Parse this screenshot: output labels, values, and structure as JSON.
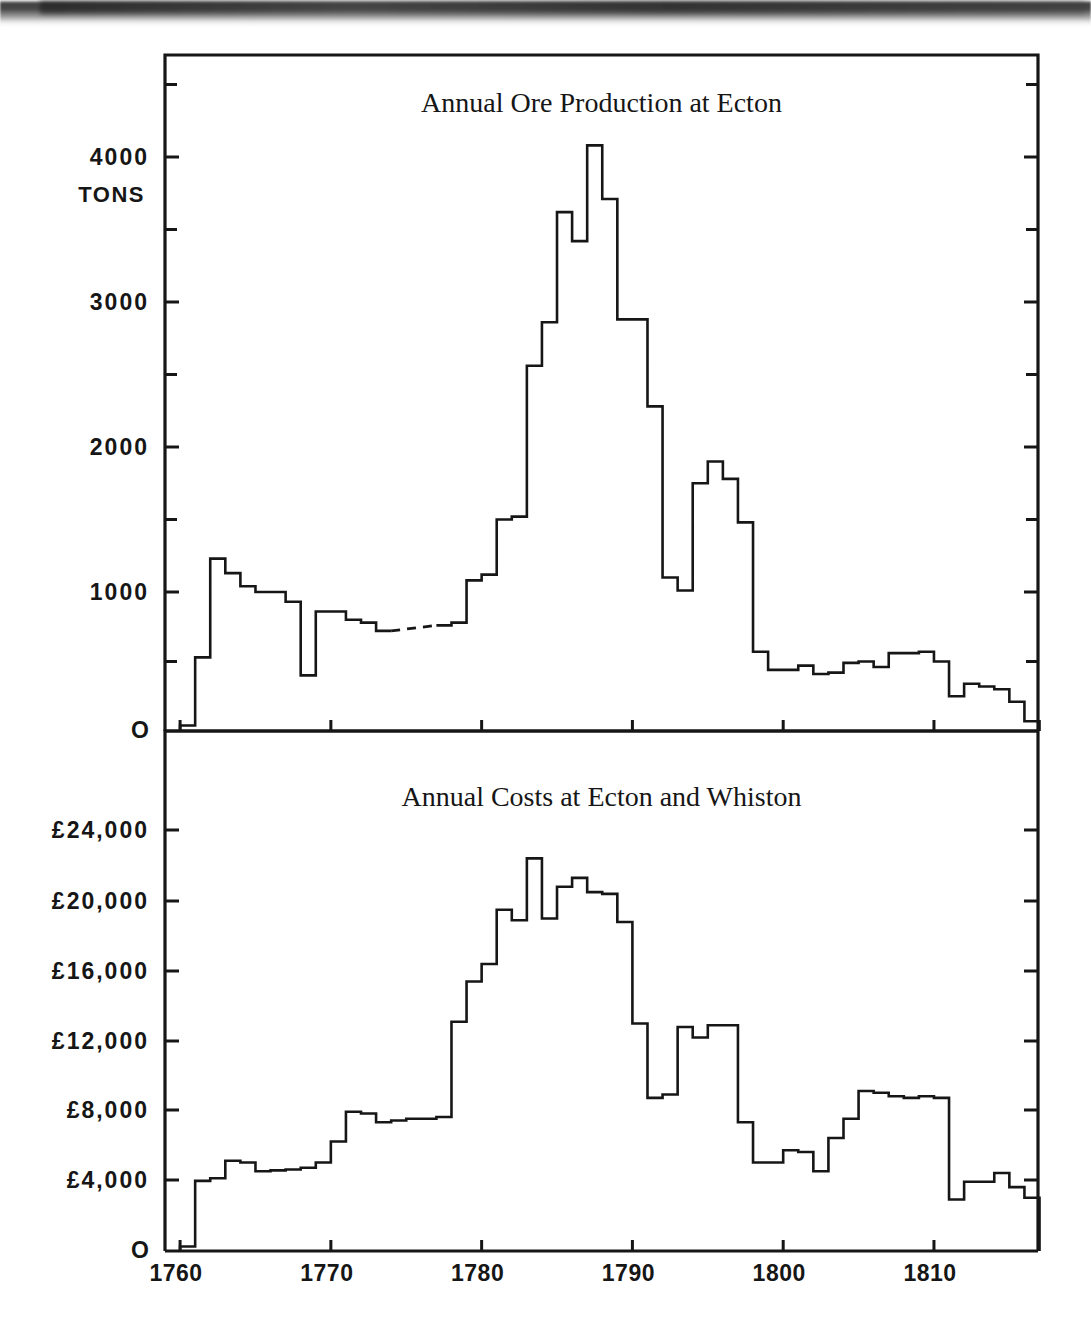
{
  "page": {
    "background": "#ffffff",
    "ink": "#161616",
    "scan_artifact": "dark-shadow-band-top"
  },
  "chart_data": [
    {
      "id": "ore-production",
      "type": "line",
      "step": true,
      "title": "Annual Ore Production at Ecton",
      "xlabel": "",
      "ylabel": "TONS",
      "xlim": [
        1759,
        1817
      ],
      "ylim": [
        0,
        4750
      ],
      "yticks_major": [
        0,
        1000,
        2000,
        3000,
        4000
      ],
      "yticks_minor": [
        500,
        1500,
        2500,
        3500,
        4500
      ],
      "ytick_labels": [
        "O",
        "1000",
        "2000",
        "3000",
        "4000"
      ],
      "xticks": [
        1760,
        1770,
        1780,
        1790,
        1800,
        1810
      ],
      "xtick_labels": [
        "1760",
        "1770",
        "1780",
        "1790",
        "1800",
        "1810"
      ],
      "grid": false,
      "legend": "none",
      "units": "tons",
      "annotation": "dashed segment 1774-1776 indicates estimated values",
      "x": [
        1760,
        1761,
        1762,
        1763,
        1764,
        1765,
        1766,
        1767,
        1768,
        1769,
        1770,
        1771,
        1772,
        1773,
        1774,
        1775,
        1776,
        1777,
        1778,
        1779,
        1780,
        1781,
        1782,
        1783,
        1784,
        1785,
        1786,
        1787,
        1788,
        1789,
        1790,
        1791,
        1792,
        1793,
        1794,
        1795,
        1796,
        1797,
        1798,
        1799,
        1800,
        1801,
        1802,
        1803,
        1804,
        1805,
        1806,
        1807,
        1808,
        1809,
        1810,
        1811,
        1812,
        1813,
        1814,
        1815,
        1816
      ],
      "values": [
        40,
        530,
        1230,
        1130,
        1040,
        1000,
        1000,
        930,
        400,
        860,
        860,
        800,
        780,
        720,
        680,
        660,
        700,
        760,
        780,
        1080,
        1120,
        1500,
        1520,
        2560,
        2860,
        3620,
        3420,
        4080,
        3710,
        2880,
        2880,
        2280,
        1100,
        1010,
        1750,
        1900,
        1780,
        1480,
        570,
        440,
        440,
        470,
        410,
        420,
        490,
        500,
        460,
        560,
        560,
        570,
        500,
        250,
        340,
        320,
        300,
        210,
        70
      ],
      "dashed_segment": {
        "x_from": 1773,
        "x_to": 1777
      }
    },
    {
      "id": "annual-costs",
      "type": "line",
      "step": true,
      "title": "Annual Costs at Ecton and Whiston",
      "xlabel": "",
      "ylabel": "",
      "xlim": [
        1759,
        1817
      ],
      "ylim": [
        0,
        25800
      ],
      "yticks_major": [
        0,
        4000,
        8000,
        12000,
        16000,
        20000,
        24000
      ],
      "ytick_labels": [
        "O",
        "£4,000",
        "£8,000",
        "£12,000",
        "£16,000",
        "£20,000",
        "£24,000"
      ],
      "xticks": [
        1760,
        1770,
        1780,
        1790,
        1800,
        1810
      ],
      "xtick_labels": [
        "1760",
        "1770",
        "1780",
        "1790",
        "1800",
        "1810"
      ],
      "grid": false,
      "legend": "none",
      "units": "pounds sterling",
      "x": [
        1760,
        1761,
        1762,
        1763,
        1764,
        1765,
        1766,
        1767,
        1768,
        1769,
        1770,
        1771,
        1772,
        1773,
        1774,
        1775,
        1776,
        1777,
        1778,
        1779,
        1780,
        1781,
        1782,
        1783,
        1784,
        1785,
        1786,
        1787,
        1788,
        1789,
        1790,
        1791,
        1792,
        1793,
        1794,
        1795,
        1796,
        1797,
        1798,
        1799,
        1800,
        1801,
        1802,
        1803,
        1804,
        1805,
        1806,
        1807,
        1808,
        1809,
        1810,
        1811,
        1812,
        1813,
        1814,
        1815,
        1816
      ],
      "values": [
        250,
        3950,
        4100,
        5100,
        5000,
        4500,
        4550,
        4600,
        4700,
        5000,
        6200,
        7900,
        7800,
        7300,
        7400,
        7500,
        7500,
        7600,
        13100,
        15400,
        16400,
        19500,
        18900,
        22400,
        19000,
        20800,
        21300,
        20500,
        20400,
        18800,
        13000,
        8700,
        8900,
        12800,
        12200,
        12900,
        12900,
        7300,
        5000,
        5000,
        5700,
        5600,
        4500,
        6400,
        7500,
        9100,
        9000,
        8800,
        8700,
        8800,
        8700,
        2900,
        3900,
        3900,
        4400,
        3600,
        3000
      ]
    }
  ],
  "top_chart": {
    "title": "Annual Ore Production at Ecton",
    "y_unit_label": "TONS",
    "y_labels": [
      "4000",
      "3000",
      "2000",
      "1000",
      "O"
    ],
    "x_labels": [
      "1760",
      "1770",
      "1780",
      "1790",
      "1800",
      "1810"
    ]
  },
  "bottom_chart": {
    "title": "Annual Costs at Ecton and Whiston",
    "y_labels": [
      "£24,000",
      "£20,000",
      "£16,000",
      "£12,000",
      "£8,000",
      "£4,000",
      "O"
    ],
    "x_labels": [
      "1760",
      "1770",
      "1780",
      "1790",
      "1800",
      "1810"
    ]
  }
}
